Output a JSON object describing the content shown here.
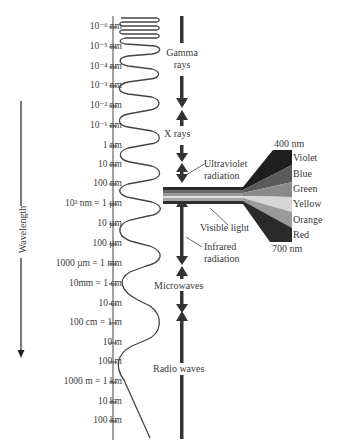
{
  "axis": {
    "title": "Wavelength",
    "ticks": [
      {
        "label": "10⁻⁶ nm",
        "y": 27
      },
      {
        "label": "10⁻⁵ nm",
        "y": 47
      },
      {
        "label": "10⁻⁴ nm",
        "y": 67
      },
      {
        "label": "10⁻³ nm",
        "y": 86
      },
      {
        "label": "10⁻² nm",
        "y": 106
      },
      {
        "label": "10⁻¹ nm",
        "y": 126
      },
      {
        "label": "1 nm",
        "y": 146
      },
      {
        "label": "10 nm",
        "y": 165
      },
      {
        "label": "100 nm",
        "y": 184
      },
      {
        "label": "10³ nm = 1 µm",
        "y": 204
      },
      {
        "label": "10 µm",
        "y": 224
      },
      {
        "label": "100 µm",
        "y": 244
      },
      {
        "label": "1000 µm = 1 mm",
        "y": 264
      },
      {
        "label": "10mm = 1 cm",
        "y": 284
      },
      {
        "label": "10 cm",
        "y": 304
      },
      {
        "label": "100 cm = 1 m",
        "y": 323
      },
      {
        "label": "10 m",
        "y": 343
      },
      {
        "label": "100 m",
        "y": 362
      },
      {
        "label": "1000 m = 1 km",
        "y": 382
      },
      {
        "label": "10 km",
        "y": 402
      },
      {
        "label": "100 km",
        "y": 421
      }
    ]
  },
  "bands": {
    "gamma": {
      "line1": "Gamma",
      "line2": "rays"
    },
    "xray": {
      "line1": "X rays"
    },
    "uv": {
      "line1": "Ultraviolet",
      "line2": "radiation"
    },
    "visible": {
      "line1": "Visible light"
    },
    "ir": {
      "line1": "Infrared",
      "line2": "radiation"
    },
    "microwave": {
      "line1": "Microwaves"
    },
    "radio": {
      "line1": "Radio waves"
    }
  },
  "visible_spectrum": {
    "top_label": "400 nm",
    "bottom_label": "700 nm",
    "colors": [
      {
        "name": "Violet",
        "fill": "#1e1e1e"
      },
      {
        "name": "Blue",
        "fill": "#5a5a5a"
      },
      {
        "name": "Green",
        "fill": "#8a8a8a"
      },
      {
        "name": "Yellow",
        "fill": "#d6d6d6"
      },
      {
        "name": "Orange",
        "fill": "#9a9a9a"
      },
      {
        "name": "Red",
        "fill": "#2a2a2a"
      }
    ]
  }
}
